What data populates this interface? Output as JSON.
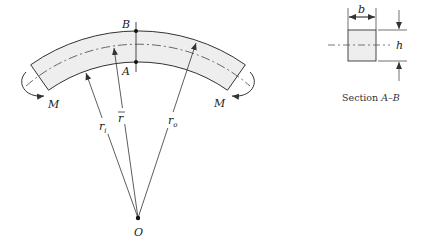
{
  "diagram": {
    "labels": {
      "point_b": "B",
      "point_a": "A",
      "moment_left": "M",
      "moment_right": "M",
      "inner_radius": "r",
      "inner_radius_sub": "i",
      "centroid_radius": "r",
      "outer_radius": "r",
      "outer_radius_sub": "o",
      "center": "O"
    },
    "section": {
      "width_label": "b",
      "height_label": "h",
      "caption_prefix": "Section ",
      "caption_ref": "A–B"
    },
    "colors": {
      "line": "#333333",
      "fill": "#eeeeee",
      "background": "#ffffff"
    }
  }
}
